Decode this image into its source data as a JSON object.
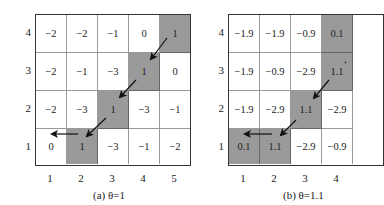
{
  "panels": [
    {
      "caption": "(a) θ=1",
      "y_labels": [
        "4",
        "3",
        "2",
        "1"
      ],
      "x_labels": [
        "1",
        "2",
        "3",
        "4",
        "5"
      ],
      "rows": [
        {
          "y": "4",
          "cells": [
            {
              "v": "−2",
              "s": false
            },
            {
              "v": "−2",
              "s": false
            },
            {
              "v": "−1",
              "s": false
            },
            {
              "v": "0",
              "s": false
            },
            {
              "v": "1",
              "s": true
            }
          ]
        },
        {
          "y": "3",
          "cells": [
            {
              "v": "−2",
              "s": false
            },
            {
              "v": "−1",
              "s": false
            },
            {
              "v": "−3",
              "s": false
            },
            {
              "v": "1",
              "s": true
            },
            {
              "v": "0",
              "s": false
            }
          ]
        },
        {
          "y": "2",
          "cells": [
            {
              "v": "−2",
              "s": false
            },
            {
              "v": "−3",
              "s": false
            },
            {
              "v": "1",
              "s": true
            },
            {
              "v": "−3",
              "s": false
            },
            {
              "v": "−1",
              "s": false
            }
          ]
        },
        {
          "y": "1",
          "cells": [
            {
              "v": "0",
              "s": false
            },
            {
              "v": "1",
              "s": true
            },
            {
              "v": "−3",
              "s": false
            },
            {
              "v": "−1",
              "s": false
            },
            {
              "v": "−2",
              "s": false
            }
          ]
        }
      ],
      "path": "(5,4) → (4,3) → (3,2) → (2,1) → (1,1)"
    },
    {
      "caption": "(b) θ=1.1",
      "y_labels": [
        "4",
        "3",
        "2",
        "1"
      ],
      "x_labels": [
        "1",
        "2",
        "3",
        "4"
      ],
      "rows": [
        {
          "y": "4",
          "cells": [
            {
              "v": "−1.9",
              "s": false
            },
            {
              "v": "−1.9",
              "s": false
            },
            {
              "v": "−0.9",
              "s": false
            },
            {
              "v": "0.1",
              "s": true
            }
          ]
        },
        {
          "y": "3",
          "cells": [
            {
              "v": "−1.9",
              "s": false
            },
            {
              "v": "−0.9",
              "s": false
            },
            {
              "v": "−2.9",
              "s": false
            },
            {
              "v": "1.1",
              "s": true
            }
          ]
        },
        {
          "y": "2",
          "cells": [
            {
              "v": "−1.9",
              "s": false
            },
            {
              "v": "−2.9",
              "s": false
            },
            {
              "v": "1.1",
              "s": true
            },
            {
              "v": "−2.9",
              "s": false
            }
          ]
        },
        {
          "y": "1",
          "cells": [
            {
              "v": "0.1",
              "s": true
            },
            {
              "v": "1.1",
              "s": true
            },
            {
              "v": "−2.9",
              "s": false
            },
            {
              "v": "−0.9",
              "s": false
            }
          ]
        }
      ],
      "path": "(4,3) → (3,2) → (2,1) → (1,1)"
    }
  ],
  "colors": {
    "shaded_cell": "#9a9a9a",
    "grid_border": "#333333",
    "arrow": "#111111"
  }
}
